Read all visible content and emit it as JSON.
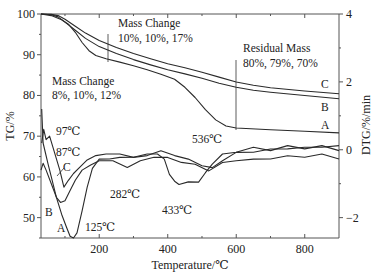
{
  "chart_data": {
    "type": "line",
    "title": "",
    "xlabel": "Temperature/℃",
    "ylabel": "TG/%",
    "y2label": "DTG/%/min",
    "xlim": [
      30,
      900
    ],
    "ylim": [
      45,
      100
    ],
    "y2lim": [
      -2.6,
      4
    ],
    "grid": false,
    "x_ticks": [
      200,
      400,
      600,
      800
    ],
    "x_minor_ticks": [
      100,
      300,
      500,
      700
    ],
    "y_ticks": [
      50,
      60,
      70,
      80,
      90,
      100
    ],
    "y2_ticks": [
      -2,
      0,
      2,
      4
    ],
    "tg_series": [
      {
        "name": "A",
        "axis": "TG",
        "x": [
          30,
          60,
          90,
          110,
          130,
          150,
          170,
          190,
          220,
          260,
          300,
          340,
          380,
          420,
          450,
          480,
          510,
          540,
          570,
          600,
          700,
          800,
          900
        ],
        "values": [
          100,
          99.6,
          98.6,
          97.5,
          95.5,
          93,
          91,
          89.8,
          89,
          88.2,
          87.3,
          86.3,
          85.2,
          84,
          82,
          79.5,
          76.5,
          74,
          72.5,
          72,
          71.6,
          71.2,
          70.8
        ]
      },
      {
        "name": "B",
        "axis": "TG",
        "x": [
          30,
          60,
          80,
          100,
          130,
          160,
          200,
          250,
          300,
          350,
          400,
          450,
          500,
          550,
          600,
          650,
          700,
          800,
          900
        ],
        "values": [
          100,
          99.8,
          99.3,
          98,
          96,
          94,
          92,
          90.3,
          88.8,
          87.5,
          86.3,
          85.3,
          84.2,
          83,
          82,
          81.3,
          80.8,
          80,
          79.2
        ]
      },
      {
        "name": "C",
        "axis": "TG",
        "x": [
          30,
          60,
          80,
          100,
          130,
          160,
          200,
          250,
          300,
          350,
          400,
          450,
          500,
          550,
          600,
          650,
          700,
          800,
          900
        ],
        "values": [
          100,
          99.9,
          99.6,
          98.7,
          97,
          95.3,
          93.5,
          91.8,
          90.3,
          89,
          87.8,
          86.8,
          85.7,
          84.5,
          83.3,
          82.5,
          81.9,
          81.1,
          80.4
        ]
      }
    ],
    "dtg_series": [
      {
        "name": "A",
        "axis": "DTG",
        "x": [
          32,
          36,
          42,
          50,
          60,
          75,
          90,
          105,
          115,
          125,
          135,
          150,
          165,
          180,
          200,
          230,
          260,
          300,
          340,
          370,
          390,
          405,
          420,
          433,
          460,
          490,
          510,
          530,
          560,
          600,
          650,
          700,
          750,
          800,
          850,
          900
        ],
        "values": [
          1.2,
          0.2,
          -0.05,
          -0.4,
          -0.8,
          -1.4,
          -1.9,
          -2.3,
          -2.55,
          -2.6,
          -2.45,
          -1.8,
          -1.1,
          -0.55,
          -0.3,
          -0.25,
          -0.25,
          -0.2,
          -0.15,
          -0.1,
          -0.3,
          -0.7,
          -0.95,
          -1.0,
          -0.97,
          -0.93,
          -0.7,
          -0.4,
          -0.15,
          -0.05,
          0.05,
          0.0,
          0.1,
          0.05,
          0.1,
          0.0
        ]
      },
      {
        "name": "B",
        "axis": "DTG",
        "x": [
          30,
          36,
          45,
          60,
          75,
          87,
          100,
          115,
          130,
          150,
          175,
          200,
          240,
          282,
          320,
          360,
          400,
          440,
          480,
          520,
          560,
          600,
          650,
          700,
          750,
          800,
          850,
          900
        ],
        "values": [
          -0.6,
          -0.4,
          -0.6,
          -1.0,
          -1.4,
          -1.55,
          -1.5,
          -1.2,
          -0.9,
          -0.6,
          -0.45,
          -0.3,
          -0.35,
          -0.5,
          -0.35,
          -0.2,
          -0.25,
          -0.35,
          -0.45,
          -0.6,
          -0.4,
          -0.3,
          -0.3,
          -0.25,
          -0.2,
          -0.2,
          -0.15,
          -0.25
        ]
      },
      {
        "name": "C",
        "axis": "DTG",
        "x": [
          32,
          38,
          45,
          55,
          70,
          85,
          97,
          110,
          125,
          145,
          165,
          190,
          220,
          260,
          300,
          340,
          380,
          420,
          460,
          500,
          530,
          560,
          600,
          650,
          700,
          750,
          800,
          850,
          900
        ],
        "values": [
          0.2,
          0.6,
          0.3,
          0.4,
          -0.1,
          -0.6,
          -1.1,
          -0.9,
          -0.7,
          -0.5,
          -0.3,
          -0.15,
          -0.15,
          -0.1,
          -0.25,
          -0.15,
          -0.05,
          -0.15,
          -0.3,
          -0.45,
          -0.55,
          -0.3,
          -0.1,
          -0.05,
          0.0,
          0.05,
          0.05,
          0.1,
          0.1
        ]
      }
    ],
    "annotations": {
      "mass_change_1": {
        "title": "Mass Change",
        "values": "8%, 10%, 12%",
        "at_temperature": 220
      },
      "mass_change_2": {
        "title": "Mass Change",
        "values": "10%, 10%, 17%",
        "at_temperature": 220
      },
      "residual_mass": {
        "title": "Residual Mass",
        "values": "80%, 79%, 70%",
        "at_temperature": 600
      },
      "peak_labels": [
        "97℃",
        "87℃",
        "125℃",
        "282℃",
        "433℃",
        "536℃"
      ],
      "curve_labels_tg": [
        "C",
        "B",
        "A"
      ],
      "curve_labels_dtg": [
        "C",
        "B",
        "A"
      ]
    }
  },
  "labels": {
    "xlabel": "Temperature/℃",
    "ylabel": "TG/%",
    "y2label": "DTG/%/min",
    "mc1_title": "Mass Change",
    "mc1_values": "8%, 10%, 12%",
    "mc2_title": "Mass Change",
    "mc2_values": "10%, 10%, 17%",
    "rm_title": "Residual Mass",
    "rm_values": "80%, 79%, 70%",
    "peak_97": "97℃",
    "peak_87": "87℃",
    "peak_125": "125℃",
    "peak_282": "282℃",
    "peak_433": "433℃",
    "peak_536": "536℃",
    "tg_C": "C",
    "tg_B": "B",
    "tg_A": "A",
    "dtg_C": "C",
    "dtg_B": "B",
    "dtg_A": "A"
  }
}
